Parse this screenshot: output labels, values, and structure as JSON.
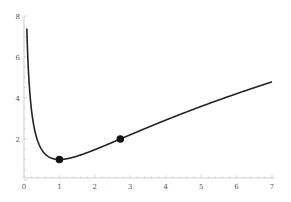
{
  "chart_data": {
    "type": "line",
    "title": "",
    "xlabel": "",
    "ylabel": "",
    "xlim": [
      0,
      7
    ],
    "ylim": [
      0,
      8
    ],
    "grid": false,
    "x_ticks": [
      "0",
      "1",
      "2",
      "3",
      "4",
      "5",
      "6",
      "7"
    ],
    "y_ticks": [
      "2",
      "4",
      "6",
      "8"
    ],
    "series": [
      {
        "name": "curve",
        "description": "y = 1 + (ln x)^2",
        "x": [
          0.05,
          0.1,
          0.2,
          0.3,
          0.5,
          0.75,
          1,
          1.5,
          2,
          2.718,
          3,
          4,
          5,
          6,
          7
        ],
        "y": [
          8.0,
          6.3,
          3.59,
          2.45,
          1.48,
          1.08,
          1.0,
          1.16,
          1.48,
          2.0,
          2.21,
          2.92,
          3.59,
          4.21,
          4.79
        ],
        "color": "#222222"
      },
      {
        "name": "points",
        "type": "scatter",
        "x": [
          1,
          2.718
        ],
        "y": [
          1,
          2
        ],
        "color": "#111111"
      }
    ]
  },
  "axis": {
    "color": "#bbbbbb"
  }
}
